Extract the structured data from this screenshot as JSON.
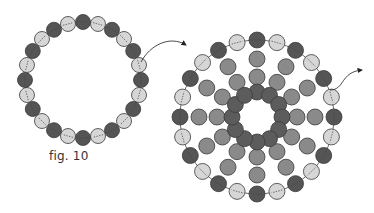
{
  "figure": {
    "caption": "fig. 10",
    "colors": {
      "dark_bead": "#555555",
      "light_bead": "#d6d6d6",
      "medium_bead": "#8a8a8a",
      "inner_bead": "#5c5c5c",
      "outline": "#3a3a3a",
      "thread": "#444444",
      "background": "#ffffff"
    },
    "small_ring": {
      "cx": 83,
      "cy": 80,
      "radius": 58,
      "bead_radius": 7.5,
      "bead_count": 24,
      "pattern": [
        "dark",
        "light"
      ]
    },
    "large_ring": {
      "cx": 257,
      "cy": 117,
      "radius": 77,
      "bead_radius": 8,
      "bead_count": 24,
      "pattern": [
        "dark",
        "light"
      ],
      "spokes": 12,
      "spoke_medium_radii": [
        58,
        40
      ],
      "inner_ring_radius": 25,
      "inner_bead_count": 12
    },
    "arrows": [
      {
        "name": "arrow-to-large-ring",
        "path": "M141,62 C150,45 170,35 186,45"
      },
      {
        "name": "arrow-exit-large-ring",
        "path": "M330,90 C345,90 340,72 362,70"
      }
    ]
  }
}
